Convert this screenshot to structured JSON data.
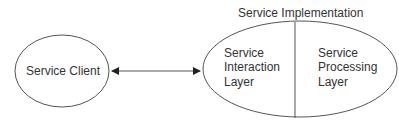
{
  "diagram": {
    "client_label": "Service Client",
    "implementation_title": "Service Implementation",
    "interaction_layer": [
      "Service",
      "Interaction",
      "Layer"
    ],
    "processing_layer": [
      "Service",
      "Processing",
      "Layer"
    ],
    "connector": "bidirectional-arrow",
    "colors": {
      "stroke": "#555555",
      "text": "#333333"
    }
  }
}
